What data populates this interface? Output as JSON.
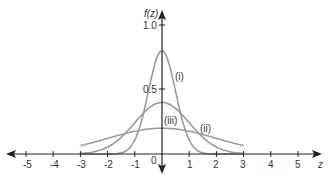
{
  "chart_data": {
    "type": "line",
    "title": "",
    "xlabel": "z",
    "ylabel": "f(z)",
    "xlim": [
      -5,
      5
    ],
    "ylim": [
      0,
      1.0
    ],
    "x_ticks": [
      "-5",
      "-4",
      "-3",
      "-2",
      "-1",
      "0",
      "1",
      "2",
      "3",
      "4",
      "5"
    ],
    "y_ticks": [
      "0.5",
      "1.0"
    ],
    "grid": false,
    "legend": "none (inline labels)",
    "series": [
      {
        "name": "(i)",
        "distribution": "normal",
        "mean": 0,
        "sd": 0.5,
        "peak": 0.8
      },
      {
        "name": "(ii)",
        "distribution": "normal",
        "mean": 0,
        "sd": 1,
        "peak": 0.4
      },
      {
        "name": "(iii)",
        "distribution": "normal",
        "mean": 0,
        "sd": 2,
        "peak": 0.2
      }
    ],
    "annotations": [
      "(i)",
      "(ii)",
      "(iii)"
    ]
  },
  "labels": {
    "ylabel": "f(z)",
    "xlabel": "z",
    "y1": "1.0",
    "y05": "0.5",
    "origin": "0",
    "i": "(i)",
    "ii": "(ii)",
    "iii": "(iii)",
    "xm5": "-5",
    "xm4": "-4",
    "xm3": "-3",
    "xm2": "-2",
    "xm1": "-1",
    "x1": "1",
    "x2": "2",
    "x3": "3",
    "x4": "4",
    "x5": "5"
  }
}
